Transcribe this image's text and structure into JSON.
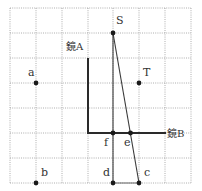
{
  "diagram": {
    "type": "mirror-reflection-grid",
    "grid": {
      "origin_px": [
        10,
        8
      ],
      "cell_px": 25.8,
      "cell_py": 25,
      "cols": 7,
      "rows": 7
    },
    "mirrors": [
      {
        "id": "mirror-a",
        "label": "鏡A",
        "from": [
          3,
          2
        ],
        "to": [
          3,
          5
        ]
      },
      {
        "id": "mirror-b",
        "label": "鏡B",
        "from": [
          3,
          5
        ],
        "to": [
          6,
          5
        ]
      }
    ],
    "points": [
      {
        "id": "S",
        "label": "S",
        "grid": [
          4,
          1
        ]
      },
      {
        "id": "T",
        "label": "T",
        "grid": [
          5,
          3
        ]
      },
      {
        "id": "a",
        "label": "a",
        "grid": [
          1,
          3
        ]
      },
      {
        "id": "b",
        "label": "b",
        "grid": [
          1,
          7
        ]
      },
      {
        "id": "c",
        "label": "c",
        "grid": [
          5,
          7
        ]
      },
      {
        "id": "d",
        "label": "d",
        "grid": [
          4,
          7
        ]
      },
      {
        "id": "e",
        "label": "e",
        "grid": [
          4.67,
          5
        ]
      },
      {
        "id": "f",
        "label": "f",
        "grid": [
          4,
          5
        ]
      }
    ],
    "segments": [
      {
        "from": "S",
        "to": "d"
      },
      {
        "from": "S",
        "to": "c"
      },
      {
        "from": "d",
        "to": "c"
      }
    ]
  },
  "labels": {
    "mirror_a": "鏡A",
    "mirror_b": "鏡B",
    "S": "S",
    "T": "T",
    "a": "a",
    "b": "b",
    "c": "c",
    "d": "d",
    "e": "e",
    "f": "f"
  }
}
